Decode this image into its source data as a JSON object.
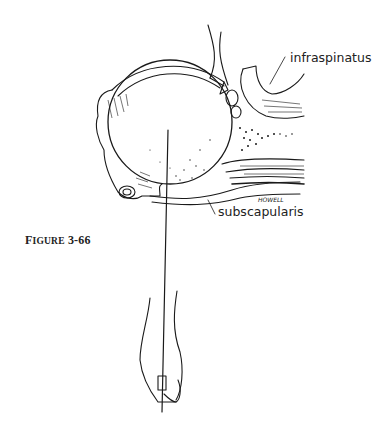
{
  "figure": {
    "caption_prefix": "F",
    "caption_smallcaps": "IGURE",
    "caption_number": "3-66",
    "labels": {
      "infraspinatus": "infraspinatus",
      "subscapularis": "subscapularis"
    },
    "artist_signature": "HOWELL"
  }
}
